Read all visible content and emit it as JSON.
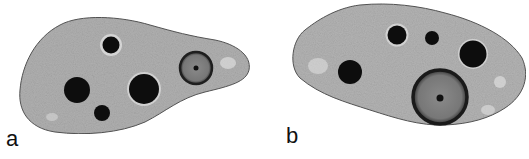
{
  "figure": {
    "panels": [
      {
        "label": "a",
        "description": "cell with four dark vacuoles and one grey nucleus with central nucleolus"
      },
      {
        "label": "b",
        "description": "cell with four dark vacuoles and one large grey nucleus with central nucleolus"
      }
    ],
    "colors": {
      "cytoplasm": "#a9a9a9",
      "cytoplasm_light": "#cfcfcf",
      "outline": "#555555",
      "vacuole": "#0d0d0d",
      "nucleus_fill": "#7d7d7d",
      "nucleus_ring": "#222222",
      "nucleolus": "#111111"
    }
  }
}
